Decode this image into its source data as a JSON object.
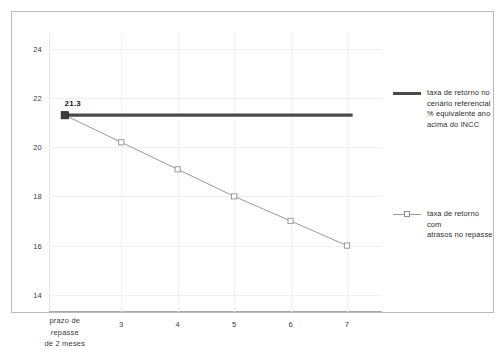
{
  "chart_data": {
    "type": "line",
    "title": "",
    "xlabel": "",
    "ylabel": "",
    "x": [
      2,
      3,
      4,
      5,
      6,
      7
    ],
    "xtick_labels": [
      "prazo de\nrepasse\nde 2 meses",
      "3",
      "4",
      "5",
      "6",
      "7"
    ],
    "ytick_labels": [
      "14",
      "16",
      "18",
      "20",
      "22",
      "24"
    ],
    "yticks": [
      14,
      16,
      18,
      20,
      22,
      24
    ],
    "ylim": [
      13.3,
      24.6
    ],
    "xlim": [
      1.72,
      7.62
    ],
    "grid": true,
    "legend_position": "right",
    "annotations": [
      {
        "text": "21.3",
        "x": 2,
        "y": 21.3
      }
    ],
    "series": [
      {
        "name": "taxa de retorno no cenário referencial % equivalente ano acima do INCC",
        "type": "line",
        "style": "thick-flat",
        "color": "#4a4a4a",
        "x": [
          2,
          7.1
        ],
        "values": [
          21.3,
          21.3
        ],
        "marker": "none"
      },
      {
        "name": "taxa de retorno com atrasos no repasse",
        "type": "line",
        "style": "thin-marker",
        "color": "#9a9a9a",
        "x": [
          2,
          3,
          4,
          5,
          6,
          7
        ],
        "values": [
          21.3,
          20.2,
          19.1,
          18.0,
          17.0,
          16.0
        ],
        "marker": "open-square"
      }
    ]
  },
  "legend": {
    "items": [
      {
        "label": "taxa de retorno no\ncenário referencial\n% equivalente ano\nacima do INCC",
        "swatch": "thick-line",
        "color": "#4a4a4a"
      },
      {
        "label": "taxa de retorno com\natrasos no repasse",
        "swatch": "line-with-open-square-marker",
        "color": "#9a9a9a"
      }
    ]
  },
  "colors": {
    "reference_line": "#4a4a4a",
    "delay_line": "#9a9a9a",
    "grid": "#f0f0f0",
    "axis": "#a8a8a8",
    "border": "#b9b9b9",
    "text": "#3a3a3a",
    "background": "#ffffff"
  }
}
